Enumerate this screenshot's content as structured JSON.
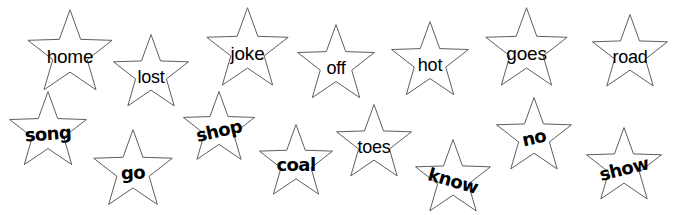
{
  "worksheet": {
    "title_clipped": "ow many words can you read in a minute? Write the total in the box at the end.",
    "background_color": "#ffffff",
    "star_outline_color": "#5e5e5e",
    "word_color": "#000000",
    "rows": 2,
    "word_count": 15,
    "words": [
      {
        "label": "home",
        "row": 1,
        "x": 24,
        "y": 8,
        "size": 92,
        "font": "plain",
        "font_size": 19,
        "rotate": 0,
        "word_dx": 0,
        "word_dy": 39
      },
      {
        "label": "lost",
        "row": 1,
        "x": 110,
        "y": 33,
        "size": 82,
        "font": "plain",
        "font_size": 18,
        "rotate": 0,
        "word_dx": 0,
        "word_dy": 35
      },
      {
        "label": "joke",
        "row": 1,
        "x": 203,
        "y": 6,
        "size": 89,
        "font": "plain",
        "font_size": 19,
        "rotate": 0,
        "word_dx": 0,
        "word_dy": 38
      },
      {
        "label": "off",
        "row": 1,
        "x": 294,
        "y": 23,
        "size": 84,
        "font": "plain",
        "font_size": 18,
        "rotate": 0,
        "word_dx": 0,
        "word_dy": 36
      },
      {
        "label": "hot",
        "row": 1,
        "x": 388,
        "y": 20,
        "size": 84,
        "font": "plain",
        "font_size": 18,
        "rotate": 0,
        "word_dx": 0,
        "word_dy": 36
      },
      {
        "label": "goes",
        "row": 1,
        "x": 482,
        "y": 6,
        "size": 89,
        "font": "plain",
        "font_size": 19,
        "rotate": 0,
        "word_dx": 0,
        "word_dy": 38
      },
      {
        "label": "road",
        "row": 1,
        "x": 589,
        "y": 13,
        "size": 82,
        "font": "plain",
        "font_size": 18,
        "rotate": 0,
        "word_dx": 0,
        "word_dy": 35
      },
      {
        "label": "song",
        "row": 2,
        "x": 6,
        "y": 90,
        "size": 84,
        "font": "round",
        "font_size": 18,
        "rotate": -4,
        "word_dx": 0,
        "word_dy": 35
      },
      {
        "label": "go",
        "row": 2,
        "x": 90,
        "y": 128,
        "size": 86,
        "font": "round",
        "font_size": 18,
        "rotate": -3,
        "word_dx": 0,
        "word_dy": 36
      },
      {
        "label": "shop",
        "row": 2,
        "x": 180,
        "y": 90,
        "size": 78,
        "font": "round",
        "font_size": 18,
        "rotate": -13,
        "word_dx": 0,
        "word_dy": 32
      },
      {
        "label": "coal",
        "row": 2,
        "x": 256,
        "y": 123,
        "size": 80,
        "font": "round",
        "font_size": 18,
        "rotate": 0,
        "word_dx": 0,
        "word_dy": 33
      },
      {
        "label": "toes",
        "row": 2,
        "x": 333,
        "y": 103,
        "size": 82,
        "font": "plain",
        "font_size": 18,
        "rotate": 0,
        "word_dx": 0,
        "word_dy": 35
      },
      {
        "label": "know",
        "row": 2,
        "x": 412,
        "y": 138,
        "size": 82,
        "font": "round",
        "font_size": 18,
        "rotate": 16,
        "word_dx": 0,
        "word_dy": 34
      },
      {
        "label": "no",
        "row": 2,
        "x": 493,
        "y": 96,
        "size": 82,
        "font": "round",
        "font_size": 18,
        "rotate": -13,
        "word_dx": 0,
        "word_dy": 33
      },
      {
        "label": "show",
        "row": 2,
        "x": 583,
        "y": 126,
        "size": 82,
        "font": "round",
        "font_size": 18,
        "rotate": -14,
        "word_dx": 0,
        "word_dy": 34
      }
    ]
  }
}
